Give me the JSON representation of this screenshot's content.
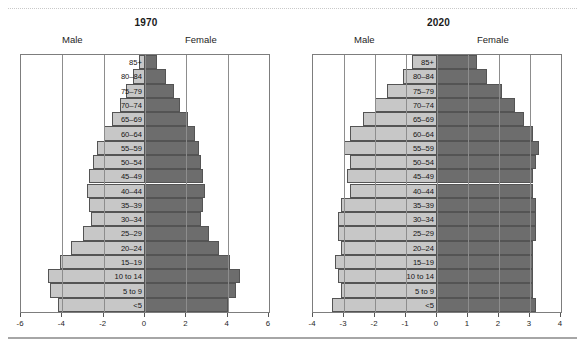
{
  "figure": {
    "top_rule": "dotted-divider",
    "bottom_rule": "solid-divider"
  },
  "panels": [
    {
      "name": "panel-1970",
      "title": "1970",
      "male_label": "Male",
      "female_label": "Female"
    },
    {
      "name": "panel-2020",
      "title": "2020",
      "male_label": "Male",
      "female_label": "Female"
    }
  ],
  "colors": {
    "male_bar": "#c7c7c7",
    "female_bar": "#6d6d6d",
    "bar_border": "#545454",
    "axis": "#7d7d7d",
    "gridline": "#8d8d8d",
    "text": "#141414"
  },
  "chart_data": [
    {
      "type": "bar",
      "name": "population-pyramid-1970",
      "title": "1970",
      "orientation": "horizontal-diverging",
      "xlabel": "",
      "ylabel": "",
      "xlim": [
        -6,
        6
      ],
      "xticks": [
        -6,
        -4,
        -2,
        0,
        2,
        4,
        6
      ],
      "xtick_labels": [
        "-6",
        "-4",
        "-2",
        "0",
        "2",
        "4",
        "6"
      ],
      "grid": true,
      "legend": [
        "Male",
        "Female"
      ],
      "legend_position": "above-axes",
      "categories": [
        "85+",
        "80–84",
        "75–79",
        "70–74",
        "65–69",
        "60–64",
        "55–59",
        "50–54",
        "45–49",
        "40–44",
        "35–39",
        "30–34",
        "25–29",
        "20–24",
        "15–19",
        "10 to 14",
        "5 to 9",
        "<5"
      ],
      "series": [
        {
          "name": "Male",
          "side": "left",
          "values": [
            -0.3,
            -0.6,
            -0.9,
            -1.2,
            -1.6,
            -2.0,
            -2.3,
            -2.5,
            -2.7,
            -2.8,
            -2.7,
            -2.6,
            -3.0,
            -3.6,
            -4.1,
            -4.7,
            -4.6,
            -4.2
          ]
        },
        {
          "name": "Female",
          "side": "right",
          "values": [
            0.6,
            1.0,
            1.4,
            1.7,
            2.1,
            2.4,
            2.6,
            2.7,
            2.8,
            2.9,
            2.8,
            2.7,
            3.1,
            3.6,
            4.1,
            4.6,
            4.4,
            4.0
          ]
        }
      ]
    },
    {
      "type": "bar",
      "name": "population-pyramid-2020",
      "title": "2020",
      "orientation": "horizontal-diverging",
      "xlabel": "",
      "ylabel": "",
      "xlim": [
        -4,
        4
      ],
      "xticks": [
        -4,
        -3,
        -2,
        -1,
        0,
        1,
        2,
        3,
        4
      ],
      "xtick_labels": [
        "-4",
        "-3",
        "-2",
        "-1",
        "0",
        "1",
        "2",
        "3",
        "4"
      ],
      "grid": true,
      "legend": [
        "Male",
        "Female"
      ],
      "legend_position": "above-axes",
      "categories": [
        "85+",
        "80–84",
        "75–79",
        "70–74",
        "65–69",
        "60–64",
        "55–59",
        "50–54",
        "45–49",
        "40–44",
        "35–39",
        "30–34",
        "25–29",
        "20–24",
        "15–19",
        "10 to 14",
        "5 to 9",
        "<5"
      ],
      "series": [
        {
          "name": "Male",
          "side": "left",
          "values": [
            -0.8,
            -1.1,
            -1.6,
            -2.0,
            -2.4,
            -2.8,
            -3.0,
            -2.8,
            -2.9,
            -2.8,
            -3.1,
            -3.2,
            -3.2,
            -3.1,
            -3.3,
            -3.2,
            -3.1,
            -3.4
          ]
        },
        {
          "name": "Female",
          "side": "right",
          "values": [
            1.3,
            1.6,
            2.1,
            2.5,
            2.8,
            3.1,
            3.3,
            3.2,
            3.1,
            3.1,
            3.2,
            3.2,
            3.2,
            3.1,
            3.1,
            3.1,
            3.1,
            3.2
          ]
        }
      ]
    }
  ]
}
